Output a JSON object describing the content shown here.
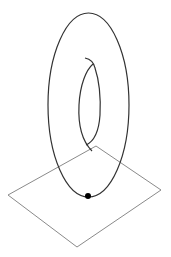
{
  "figure": {
    "colors": {
      "background": "#ffffff",
      "curve": "#333333",
      "plane": "#8a8a8a",
      "point": "#000000"
    },
    "outer_loop": {
      "cx": 88.5,
      "cy": 105,
      "rx": 40.5,
      "ry": 92
    },
    "inner_loop": {
      "path": "M85,58 C90,59 94,63 95,68 C99,80 101,95 100,115 C99,130 95,141 86,145 M93,64 C86,70 80,85 79,105 C78,125 81,140 92,151"
    },
    "plane": {
      "points": "96,146 161,190 77,247 8,195"
    },
    "tangent_point": {
      "cx": 88,
      "cy": 196,
      "r": 3
    }
  }
}
